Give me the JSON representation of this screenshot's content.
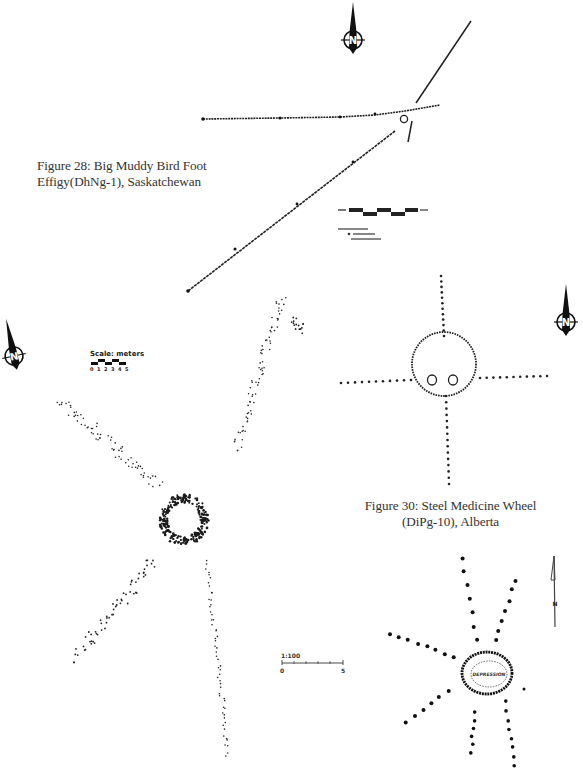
{
  "figures": [
    {
      "id": "fig28",
      "caption_line1": "Figure 28: Big Muddy Bird Foot",
      "caption_line2": "Effigy(DhNg-1), Saskatchewan",
      "north_arrow_label": "N",
      "scale_legend": {
        "legend_text_note": "illegible legend: boulder lines, boulder cairns",
        "segments": 5
      }
    },
    {
      "id": "fig29",
      "north_arrow_label": "N",
      "scale": {
        "label": "Scale: meters",
        "ticks": [
          "0",
          "1",
          "2",
          "3",
          "4",
          "5"
        ]
      }
    },
    {
      "id": "fig30",
      "caption_line1": "Figure 30: Steel Medicine Wheel",
      "caption_line2": "(DiPg-10), Alberta",
      "north_arrow_label": "N"
    },
    {
      "id": "fig31",
      "north_arrow_label": "N",
      "center_label": "DEPRESSION",
      "scale": {
        "ratio": "1:100",
        "start": "0",
        "end": "5"
      }
    }
  ],
  "colors": {
    "ink": "#111111",
    "caption": "#333333",
    "background": "#ffffff"
  }
}
